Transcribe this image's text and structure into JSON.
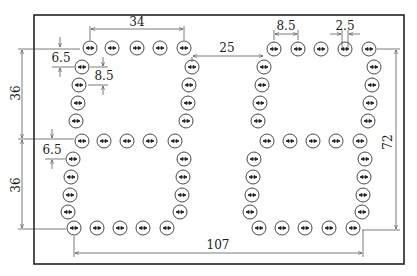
{
  "diagram": {
    "frame": {
      "x": 34,
      "y": 15,
      "w": 370,
      "h": 249
    },
    "led_radius": 7,
    "dimensions": {
      "digit_width": "34",
      "digit_gap": "25",
      "led_pitch": "8.5",
      "led_size": "2.5",
      "upper_half_height": "36",
      "lower_half_height": "36",
      "top_offset": "6.5",
      "row_offset": "8.5",
      "middle_offset": "6.5",
      "total_height": "72",
      "total_width": "107"
    },
    "digits": [
      {
        "name": "left-digit",
        "top_row": [
          [
            90,
            48
          ],
          [
            112,
            48
          ],
          [
            137,
            48
          ],
          [
            160,
            48
          ],
          [
            184,
            48
          ]
        ],
        "upper_left": [
          [
            82,
            67
          ],
          [
            79,
            85
          ],
          [
            78,
            103
          ],
          [
            76,
            121
          ]
        ],
        "upper_right": [
          [
            192,
            67
          ],
          [
            189,
            85
          ],
          [
            188,
            103
          ],
          [
            186,
            121
          ]
        ],
        "middle_row": [
          [
            82,
            141
          ],
          [
            104,
            141
          ],
          [
            127,
            141
          ],
          [
            150,
            141
          ],
          [
            175,
            141
          ]
        ],
        "lower_left": [
          [
            73,
            159
          ],
          [
            71,
            177
          ],
          [
            70,
            195
          ],
          [
            68,
            212
          ]
        ],
        "lower_right": [
          [
            184,
            159
          ],
          [
            183,
            177
          ],
          [
            182,
            195
          ],
          [
            180,
            212
          ]
        ],
        "bottom_row": [
          [
            74,
            228
          ],
          [
            97,
            228
          ],
          [
            120,
            228
          ],
          [
            143,
            228
          ],
          [
            167,
            228
          ]
        ]
      },
      {
        "name": "right-digit",
        "top_row": [
          [
            274,
            49
          ],
          [
            298,
            49
          ],
          [
            321,
            49
          ],
          [
            345,
            49
          ],
          [
            369,
            49
          ]
        ],
        "upper_left": [
          [
            264,
            67
          ],
          [
            262,
            85
          ],
          [
            260,
            103
          ],
          [
            258,
            121
          ]
        ],
        "upper_right": [
          [
            374,
            67
          ],
          [
            372,
            85
          ],
          [
            370,
            103
          ],
          [
            368,
            121
          ]
        ],
        "middle_row": [
          [
            267,
            141
          ],
          [
            290,
            141
          ],
          [
            313,
            141
          ],
          [
            336,
            141
          ],
          [
            360,
            141
          ]
        ],
        "lower_left": [
          [
            254,
            159
          ],
          [
            253,
            177
          ],
          [
            252,
            195
          ],
          [
            250,
            212
          ]
        ],
        "lower_right": [
          [
            365,
            159
          ],
          [
            364,
            177
          ],
          [
            363,
            195
          ],
          [
            362,
            212
          ]
        ],
        "bottom_row": [
          [
            259,
            228
          ],
          [
            282,
            228
          ],
          [
            305,
            228
          ],
          [
            329,
            228
          ],
          [
            353,
            228
          ]
        ]
      }
    ]
  }
}
